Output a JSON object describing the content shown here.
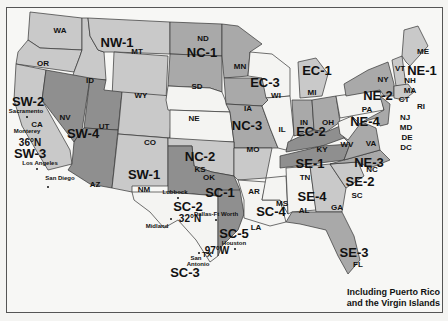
{
  "map": {
    "type": "US jurisdiction regions map",
    "note_line1": "Including Puerto Rico",
    "note_line2": "and the Virgin Islands",
    "colors": {
      "light": "#c9c9c9",
      "medium": "#a9a9a9",
      "dark": "#8f8f8f",
      "white": "#f4f4f2",
      "border": "#333333"
    },
    "regions": [
      {
        "code": "NW-1",
        "states": [
          "WA",
          "OR",
          "ID",
          "MT",
          "WY"
        ]
      },
      {
        "code": "SW-1",
        "states": [
          "CO",
          "NM"
        ]
      },
      {
        "code": "SW-2",
        "states": [
          "CA"
        ]
      },
      {
        "code": "SW-3",
        "states": [
          "CA"
        ]
      },
      {
        "code": "SW-4",
        "states": [
          "NV",
          "UT",
          "AZ"
        ]
      },
      {
        "code": "NC-1",
        "states": [
          "ND",
          "SD",
          "MN"
        ]
      },
      {
        "code": "NC-2",
        "states": [
          "NE",
          "KS"
        ]
      },
      {
        "code": "NC-3",
        "states": [
          "IA",
          "MO"
        ]
      },
      {
        "code": "SC-1",
        "states": [
          "OK",
          "AR"
        ]
      },
      {
        "code": "SC-2",
        "states": [
          "TX"
        ]
      },
      {
        "code": "SC-3",
        "states": [
          "TX"
        ]
      },
      {
        "code": "SC-4",
        "states": [
          "LA",
          "MS"
        ]
      },
      {
        "code": "SC-5",
        "states": [
          "TX"
        ]
      },
      {
        "code": "EC-1",
        "states": [
          "MI"
        ]
      },
      {
        "code": "EC-2",
        "states": [
          "IN",
          "OH"
        ]
      },
      {
        "code": "EC-3",
        "states": [
          "WI",
          "IL"
        ]
      },
      {
        "code": "NE-1",
        "states": [
          "ME",
          "VT",
          "NH",
          "MA",
          "CT",
          "RI"
        ]
      },
      {
        "code": "NE-2",
        "states": [
          "NY"
        ]
      },
      {
        "code": "NE-3",
        "states": [
          "VA",
          "NC"
        ]
      },
      {
        "code": "NE-4",
        "states": [
          "PA",
          "NJ",
          "MD",
          "DE",
          "DC",
          "WV"
        ]
      },
      {
        "code": "SE-1",
        "states": [
          "KY",
          "TN"
        ]
      },
      {
        "code": "SE-2",
        "states": [
          "SC"
        ]
      },
      {
        "code": "SE-3",
        "states": [
          "FL"
        ]
      },
      {
        "code": "SE-4",
        "states": [
          "AL",
          "GA"
        ]
      }
    ],
    "labels": {
      "wa": "WA",
      "or": "OR",
      "id": "ID",
      "mt": "MT",
      "wy": "WY",
      "nw1": "NW-1",
      "sw2": "SW-2",
      "sw3": "SW-3",
      "sw4": "SW-4",
      "sw1": "SW-1",
      "ca": "CA",
      "nv": "NV",
      "ut": "UT",
      "az": "AZ",
      "co": "CO",
      "nm": "NM",
      "nd": "ND",
      "sd": "SD",
      "ne": "NE",
      "ks": "KS",
      "mn": "MN",
      "ia": "IA",
      "mo": "MO",
      "nc1": "NC-1",
      "nc2": "NC-2",
      "nc3": "NC-3",
      "ok": "OK",
      "ar": "AR",
      "tx": "TX",
      "la": "LA",
      "ms": "MS",
      "sc1": "SC-1",
      "sc2": "SC-2",
      "sc3": "SC-3",
      "sc4": "SC-4",
      "sc5": "SC-5",
      "wi": "WI",
      "il": "IL",
      "mi": "MI",
      "in": "IN",
      "oh": "OH",
      "ec1": "EC-1",
      "ec2": "EC-2",
      "ec3": "EC-3",
      "ky": "KY",
      "tn": "TN",
      "al": "AL",
      "ga": "GA",
      "fl": "FL",
      "sc": "SC",
      "ncst": "NC",
      "se1": "SE-1",
      "se2": "SE-2",
      "se3": "SE-3",
      "se4": "SE-4",
      "me": "ME",
      "vt": "VT",
      "nh": "NH",
      "ma": "MA",
      "ct": "CT",
      "ri": "RI",
      "ny": "NY",
      "pa": "PA",
      "nj": "NJ",
      "md": "MD",
      "de": "DE",
      "dc": "DC",
      "wv": "WV",
      "va": "VA",
      "ne1": "NE-1",
      "ne2": "NE-2",
      "ne3": "NE-3",
      "ne4": "NE-4"
    },
    "cities": {
      "sacramento": "Sacramento",
      "monterey": "Monterey",
      "los_angeles": "Los Angeles",
      "san_diego": "San Diego",
      "lubbock": "Lubbock",
      "dallas": "Dallas-Ft Worth",
      "midland": "Midland",
      "san_antonio_1": "San",
      "san_antonio_2": "Antonio",
      "houston": "Houston"
    },
    "coordinates": {
      "lat36": "36°N",
      "lat32": "32°N",
      "lon97": "97°W"
    }
  }
}
